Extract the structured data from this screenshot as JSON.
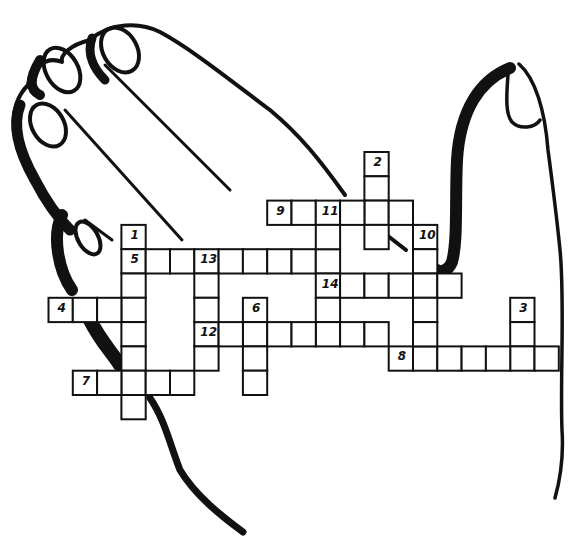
{
  "colors": {
    "ink": "#111111",
    "background": "#ffffff"
  },
  "grid": {
    "cell_size": 24.3,
    "origin_x": 48.5,
    "origin_y": 152,
    "entries": [
      {
        "number": "1",
        "direction": "down",
        "col": 3,
        "row": 3,
        "length": 8
      },
      {
        "number": "2",
        "direction": "down",
        "col": 13,
        "row": 0,
        "length": 4
      },
      {
        "number": "3",
        "direction": "down",
        "col": 19,
        "row": 6,
        "length": 3
      },
      {
        "number": "4",
        "direction": "across",
        "col": 0,
        "row": 6,
        "length": 4
      },
      {
        "number": "5",
        "direction": "across",
        "col": 3,
        "row": 4,
        "length": 9
      },
      {
        "number": "6",
        "direction": "down",
        "col": 8,
        "row": 6,
        "length": 4
      },
      {
        "number": "7",
        "direction": "across",
        "col": 1,
        "row": 9,
        "length": 5
      },
      {
        "number": "8",
        "direction": "across",
        "col": 14,
        "row": 8,
        "length": 7
      },
      {
        "number": "9",
        "direction": "across",
        "col": 9,
        "row": 2,
        "length": 6
      },
      {
        "number": "10",
        "direction": "down",
        "col": 15,
        "row": 3,
        "length": 6
      },
      {
        "number": "11",
        "direction": "down",
        "col": 11,
        "row": 2,
        "length": 6
      },
      {
        "number": "12",
        "direction": "across",
        "col": 6,
        "row": 7,
        "length": 8
      },
      {
        "number": "13",
        "direction": "down",
        "col": 6,
        "row": 4,
        "length": 5
      },
      {
        "number": "14",
        "direction": "across",
        "col": 11,
        "row": 5,
        "length": 6
      }
    ]
  }
}
